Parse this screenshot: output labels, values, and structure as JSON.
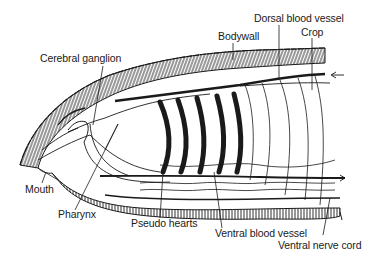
{
  "diagram": {
    "colors": {
      "ink": "#1a1a1a",
      "background": "#ffffff"
    },
    "labels": {
      "cerebral_ganglion": "Cerebral ganglion",
      "bodywall": "Bodywall",
      "dorsal_blood_vessel": "Dorsal blood vessel",
      "crop": "Crop",
      "mouth": "Mouth",
      "pharynx": "Pharynx",
      "pseudo_hearts": "Pseudo hearts",
      "ventral_blood_vessel": "Ventral blood vessel",
      "ventral_nerve_cord": "Ventral nerve cord"
    },
    "pseudo_heart_count": 5,
    "flow_arrows": {
      "dorsal": "left-pointing (anterior flow)",
      "ventral": "right-pointing (posterior flow)"
    }
  }
}
